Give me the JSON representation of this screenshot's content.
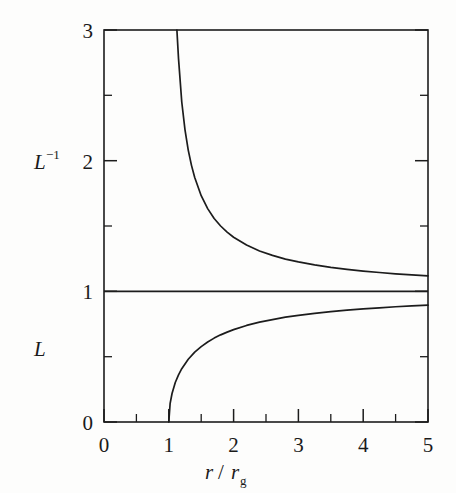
{
  "figure": {
    "background_color": "#fdfdfc",
    "ink_color": "#1c1c1c",
    "width": 456,
    "height": 493
  },
  "chart_data": {
    "type": "line",
    "title": "",
    "subtitle": "",
    "xlabel": "r / r_g",
    "xlabel_parts": {
      "numerator": "r",
      "divider": "/",
      "denominator": "r",
      "denominator_sub": "g"
    },
    "ylabel": "",
    "ylabel_upper": "L−1",
    "ylabel_upper_parts": {
      "base": "L",
      "exponent": "−1"
    },
    "ylabel_lower": "L",
    "xlim": [
      0,
      5
    ],
    "ylim": [
      0,
      3
    ],
    "xticks": [
      0,
      1,
      2,
      3,
      4,
      5
    ],
    "xticklabels": [
      "0",
      "1",
      "2",
      "3",
      "4",
      "5"
    ],
    "xminorticks": [
      0.5,
      1.5,
      2.5,
      3.5,
      4.5
    ],
    "yticks": [
      0,
      1,
      2,
      3
    ],
    "yticklabels": [
      "0",
      "1",
      "2",
      "3"
    ],
    "yminorticks": [
      0.5,
      1.5,
      2.5
    ],
    "grid": false,
    "legend": "none",
    "tick_direction": "in",
    "frame": "box",
    "series": [
      {
        "name": "L−1",
        "formula": "1/sqrt(1 - 1/x)",
        "label_position": "upper-left",
        "x": [
          1.125,
          1.15,
          1.2,
          1.25,
          1.3,
          1.35,
          1.4,
          1.5,
          1.6,
          1.7,
          1.8,
          1.9,
          2.0,
          2.2,
          2.4,
          2.6,
          2.8,
          3.0,
          3.25,
          3.5,
          3.75,
          4.0,
          4.25,
          4.5,
          4.75,
          5.0
        ],
        "values": [
          3.0,
          2.781,
          2.449,
          2.236,
          2.081,
          1.964,
          1.871,
          1.732,
          1.633,
          1.557,
          1.5,
          1.453,
          1.414,
          1.354,
          1.309,
          1.275,
          1.247,
          1.225,
          1.202,
          1.183,
          1.168,
          1.155,
          1.144,
          1.134,
          1.126,
          1.118
        ]
      },
      {
        "name": "L",
        "formula": "sqrt(1 - 1/x)",
        "label_position": "lower-left",
        "x": [
          1.0,
          1.02,
          1.05,
          1.1,
          1.15,
          1.2,
          1.3,
          1.4,
          1.5,
          1.6,
          1.7,
          1.8,
          1.9,
          2.0,
          2.2,
          2.4,
          2.6,
          2.8,
          3.0,
          3.25,
          3.5,
          3.75,
          4.0,
          4.25,
          4.5,
          4.75,
          5.0
        ],
        "values": [
          0.0,
          0.14,
          0.218,
          0.302,
          0.361,
          0.408,
          0.48,
          0.535,
          0.577,
          0.612,
          0.642,
          0.667,
          0.688,
          0.707,
          0.739,
          0.764,
          0.784,
          0.802,
          0.816,
          0.832,
          0.845,
          0.856,
          0.866,
          0.874,
          0.882,
          0.889,
          0.894
        ]
      },
      {
        "name": "asymptote",
        "formula": "y = 1",
        "x": [
          0,
          5
        ],
        "values": [
          1,
          1
        ]
      }
    ],
    "annotations": [
      {
        "text": "L−1",
        "at_y": 2.0,
        "side": "left-outside"
      },
      {
        "text": "L",
        "at_y": 0.58,
        "side": "left-outside"
      }
    ]
  }
}
